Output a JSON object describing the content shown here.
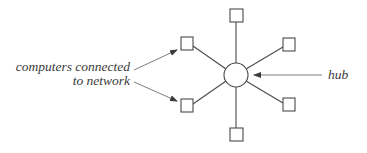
{
  "diagram": {
    "type": "star-network-topology",
    "hub": {
      "label": "hub",
      "cx": 236,
      "cy": 75,
      "r": 12
    },
    "nodes": [
      {
        "id": "top",
        "x": 230,
        "y": 9,
        "size": 13
      },
      {
        "id": "upper-left",
        "x": 181,
        "y": 37,
        "size": 13
      },
      {
        "id": "upper-right",
        "x": 283,
        "y": 38,
        "size": 13
      },
      {
        "id": "lower-left",
        "x": 181,
        "y": 99,
        "size": 13
      },
      {
        "id": "lower-right",
        "x": 283,
        "y": 98,
        "size": 13
      },
      {
        "id": "bottom",
        "x": 230,
        "y": 128,
        "size": 13
      }
    ],
    "labels": {
      "computers_line1": "computers connected",
      "computers_line2": "to network",
      "hub": "hub"
    },
    "colors": {
      "stroke": "#4a4a4a",
      "text": "#3a3a3a",
      "background": "#ffffff"
    }
  }
}
